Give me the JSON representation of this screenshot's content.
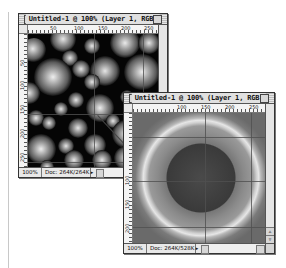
{
  "windows": [
    {
      "id": "spheres",
      "title": "Untitled-1 @ 100% (Layer 1, RGB)",
      "ruler_h_ticks": [
        "50",
        "100",
        "150",
        "200",
        "250"
      ],
      "ruler_v_ticks": [
        "50",
        "100",
        "150",
        "200",
        "250"
      ],
      "status": {
        "zoom": "100%",
        "doc": "Doc: 264K/264K"
      }
    },
    {
      "id": "rings",
      "title": "Untitled-1 @ 100% (Layer 1, RGB)",
      "ruler_h_ticks": [
        "100",
        "150",
        "200",
        "250"
      ],
      "ruler_v_ticks": [
        "100",
        "150",
        "200"
      ],
      "status": {
        "zoom": "100%",
        "doc": "Doc: 264K/528K"
      }
    }
  ],
  "icons": {
    "status_menu_arrow": "▸",
    "scroll_up": "▵",
    "scroll_down": "▿"
  },
  "colors": {
    "canvas1_bg": "#050505",
    "canvas2_bg": "#6a6a6a",
    "ring": "#dcdcdc",
    "inner_disc": "#3a3a3a"
  }
}
